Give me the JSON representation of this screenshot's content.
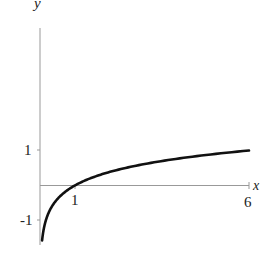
{
  "chart_data": {
    "type": "line",
    "title": "",
    "function": "y = log_6(x)",
    "xlabel": "x",
    "ylabel": "y",
    "x_ticks": [
      {
        "value": 1,
        "label": "1"
      },
      {
        "value": 6,
        "label": "6"
      }
    ],
    "y_ticks": [
      {
        "value": 1,
        "label": "1"
      },
      {
        "value": -1,
        "label": "-1"
      }
    ],
    "xlim": [
      0,
      6
    ],
    "ylim": [
      -1.6,
      4.8
    ],
    "grid": false,
    "legend": null,
    "series": [
      {
        "name": "log6(x)",
        "color": "#111111",
        "x": [
          0.06,
          0.1,
          0.15,
          0.2,
          0.3,
          0.4,
          0.5,
          0.7,
          1,
          1.5,
          2,
          2.5,
          3,
          3.5,
          4,
          4.5,
          5,
          5.5,
          6
        ],
        "y": [
          -1.57,
          -1.29,
          -1.06,
          -0.9,
          -0.67,
          -0.51,
          -0.39,
          -0.2,
          0,
          0.23,
          0.39,
          0.51,
          0.61,
          0.7,
          0.77,
          0.84,
          0.9,
          0.95,
          1.0
        ]
      }
    ]
  },
  "labels": {
    "x_axis": "x",
    "y_axis": "y",
    "tick_x_1": "1",
    "tick_x_6": "6",
    "tick_y_1": "1",
    "tick_y_neg1": "-1"
  }
}
